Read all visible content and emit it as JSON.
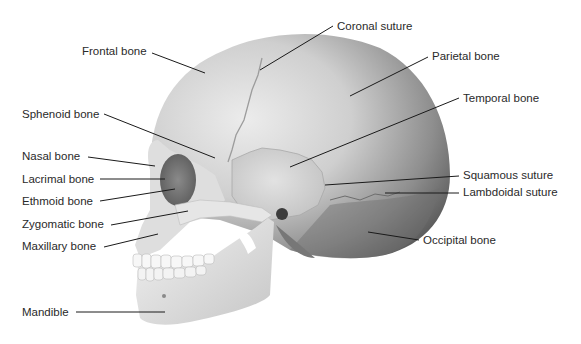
{
  "diagram": {
    "labels": [
      {
        "id": "frontal",
        "text": "Frontal bone",
        "x": 82,
        "y": 45,
        "line": [
          152,
          53,
          205,
          73
        ]
      },
      {
        "id": "coronal",
        "text": "Coronal suture",
        "x": 337,
        "y": 20,
        "line": [
          333,
          26,
          260,
          70
        ]
      },
      {
        "id": "parietal",
        "text": "Parietal bone",
        "x": 432,
        "y": 50,
        "line": [
          428,
          57,
          350,
          96
        ]
      },
      {
        "id": "temporal",
        "text": "Temporal bone",
        "x": 463,
        "y": 92,
        "line": [
          459,
          98,
          290,
          167
        ]
      },
      {
        "id": "sphenoid",
        "text": "Sphenoid bone",
        "x": 22,
        "y": 108,
        "line": [
          104,
          114,
          215,
          158
        ]
      },
      {
        "id": "squamous",
        "text": "Squamous suture",
        "x": 463,
        "y": 169,
        "line": [
          459,
          176,
          325,
          185
        ]
      },
      {
        "id": "nasal",
        "text": "Nasal bone",
        "x": 22,
        "y": 150,
        "line": [
          88,
          157,
          155,
          166
        ]
      },
      {
        "id": "lacrimal",
        "text": "Lacrimal bone",
        "x": 22,
        "y": 173,
        "line": [
          100,
          179,
          165,
          179
        ]
      },
      {
        "id": "lambdoidal",
        "text": "Lambdoidal suture",
        "x": 463,
        "y": 186,
        "line": [
          459,
          193,
          385,
          193
        ]
      },
      {
        "id": "ethmoid",
        "text": "Ethmoid bone",
        "x": 22,
        "y": 195,
        "line": [
          100,
          201,
          175,
          189
        ]
      },
      {
        "id": "zygomatic",
        "text": "Zygomatic bone",
        "x": 22,
        "y": 218,
        "line": [
          111,
          225,
          188,
          211
        ]
      },
      {
        "id": "maxillary",
        "text": "Maxillary bone",
        "x": 22,
        "y": 240,
        "line": [
          104,
          247,
          158,
          234
        ]
      },
      {
        "id": "occipital",
        "text": "Occipital bone",
        "x": 423,
        "y": 234,
        "line": [
          419,
          240,
          368,
          232
        ]
      },
      {
        "id": "mandible",
        "text": "Mandible",
        "x": 22,
        "y": 306,
        "line": [
          76,
          312,
          165,
          312
        ]
      }
    ]
  },
  "colors": {
    "bone_light": "#e6e6e6",
    "bone_mid": "#c9c9c9",
    "bone_dark": "#7d7d7d",
    "leader_line": "#1a1a1a",
    "label_text": "#2a2a2a",
    "background": "#ffffff"
  }
}
